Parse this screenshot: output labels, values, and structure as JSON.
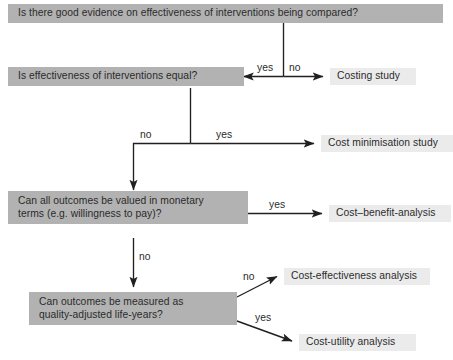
{
  "diagram": {
    "title_text": "Economic evaluation decision flowchart",
    "nodes": {
      "q_evidence": {
        "lines": [
          "Is there good evidence on effectiveness of interventions being compared?"
        ],
        "kind": "question"
      },
      "q_equal": {
        "lines": [
          "Is effectiveness of interventions equal?"
        ],
        "kind": "question"
      },
      "q_monetary": {
        "lines": [
          "Can all outcomes be valued in monetary",
          "terms (e.g. willingness to pay)?"
        ],
        "kind": "question"
      },
      "q_qaly": {
        "lines": [
          "Can outcomes be measured as",
          "quality-adjusted life-years?"
        ],
        "kind": "question"
      },
      "o_costing": {
        "lines": [
          "Costing study"
        ],
        "kind": "outcome"
      },
      "o_cost_min": {
        "lines": [
          "Cost minimisation study"
        ],
        "kind": "outcome"
      },
      "o_cba": {
        "lines": [
          "Cost–benefit-analysis"
        ],
        "kind": "outcome"
      },
      "o_cea": {
        "lines": [
          "Cost-effectiveness analysis"
        ],
        "kind": "outcome"
      },
      "o_cua": {
        "lines": [
          "Cost-utility analysis"
        ],
        "kind": "outcome"
      }
    },
    "edge_labels": {
      "evidence_yes": "yes",
      "evidence_no": "no",
      "equal_no": "no",
      "equal_yes": "yes",
      "monetary_yes": "yes",
      "monetary_no": "no",
      "qaly_no": "no",
      "qaly_yes": "yes"
    },
    "colors": {
      "question_fill": "#b2b2b2",
      "outcome_fill": "#ebebeb",
      "line": "#231f20",
      "text": "#2b2b2b",
      "background": "#ffffff"
    }
  }
}
